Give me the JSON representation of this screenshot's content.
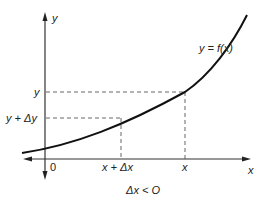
{
  "diagram": {
    "axes": {
      "y_label": "y",
      "x_label": "x",
      "origin_label": "0"
    },
    "curve": {
      "label": "y = f(x)"
    },
    "points": {
      "upper": {
        "x_label": "x",
        "y_label": "y"
      },
      "lower": {
        "x_label": "x + Δx",
        "y_label": "y + Δy"
      }
    },
    "caption": "Δx < O",
    "colors": {
      "line": "#222222",
      "dashed": "#555555",
      "background": "#ffffff"
    }
  }
}
